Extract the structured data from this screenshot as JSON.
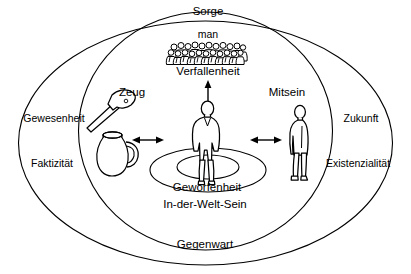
{
  "diagram": {
    "title_concept": "Heidegger Sorge / In-der-Welt-Sein Diagramm",
    "colors": {
      "stroke": "#000000",
      "background": "#ffffff",
      "text": "#000000"
    },
    "labels": {
      "sorge": "Sorge",
      "man": "man",
      "verfallenheit": "Verfallenheit",
      "zeug": "Zeug",
      "mitsein": "Mitsein",
      "gewesenheit": "Gewesenheit",
      "faktizitaet": "Faktizität",
      "zukunft": "Zukunft",
      "existenzialitaet": "Existenzialität",
      "geworfenheit": "Geworfenheit",
      "in_der_welt_sein": "In-der-Welt-Sein",
      "gegenwart": "Gegenwart"
    },
    "icons": {
      "hammer": "hammer-icon",
      "jug": "jug-icon",
      "dasein_figure": "person-front-figure-icon",
      "other_figure": "person-profile-figure-icon",
      "crowd": "crowd-figures-icon",
      "arrow_up_down": "arrow-up-down-icon",
      "arrow_left_right_west": "arrow-left-right-icon",
      "arrow_left_right_east": "arrow-left-right-icon"
    },
    "shapes": {
      "outer_ellipse": "outer-ellipse",
      "inner_ellipse": "inner-ellipse",
      "ground_ellipse_outer": "ground-ellipse-outer",
      "ground_ellipse_inner": "ground-ellipse-inner"
    }
  }
}
